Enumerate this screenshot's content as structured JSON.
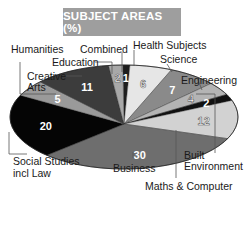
{
  "title": "SUBJECT AREAS (%)",
  "chart_data": {
    "type": "pie",
    "title": "SUBJECT AREAS (%)",
    "unit": "%",
    "categories": [
      "Combined",
      "Health Subjects",
      "Science",
      "Engineering",
      "Built Environment",
      "Maths & Computer",
      "Business",
      "Social Studies incl Law",
      "Humanities",
      "Creative Arts",
      "Education"
    ],
    "values": [
      1,
      6,
      7,
      4,
      2,
      12,
      30,
      20,
      5,
      11,
      2
    ],
    "style": "3D-tilted ellipse, grayscale",
    "legend": "none (callout labels with leader lines)"
  },
  "slices": [
    {
      "label": "Combined",
      "value": "1",
      "color": "#1e1e1e"
    },
    {
      "label": "Health Subjects",
      "value": "6",
      "color": "#e6e6e6"
    },
    {
      "label": "Science",
      "value": "7",
      "color": "#8a8a8a"
    },
    {
      "label": "Engineering",
      "value": "4",
      "color": "#b4b4b4"
    },
    {
      "label": "Built Environment",
      "value": "2",
      "color": "#111111"
    },
    {
      "label": "Maths & Computer",
      "value": "12",
      "color": "#d2d2d2"
    },
    {
      "label": "Business",
      "value": "30",
      "color": "#6e6e6e"
    },
    {
      "label": "Social Studies incl Law",
      "value": "20",
      "color": "#050505"
    },
    {
      "label": "Humanities",
      "value": "5",
      "color": "#9a9a9a"
    },
    {
      "label": "Creative Arts",
      "value": "11",
      "color": "#3c3c3c"
    },
    {
      "label": "Education",
      "value": "2",
      "color": "#a8a8a8"
    }
  ],
  "labels": {
    "humanities": "Humanities",
    "combined": "Combined",
    "health": "Health Subjects",
    "education": "Education",
    "science": "Science",
    "creative_1": "Creative",
    "creative_2": "Arts",
    "engineering": "Engineering",
    "social_1": "Social Studies",
    "social_2": "incl Law",
    "business": "Business",
    "built_1": "Built",
    "built_2": "Environment",
    "maths": "Maths & Computer"
  }
}
